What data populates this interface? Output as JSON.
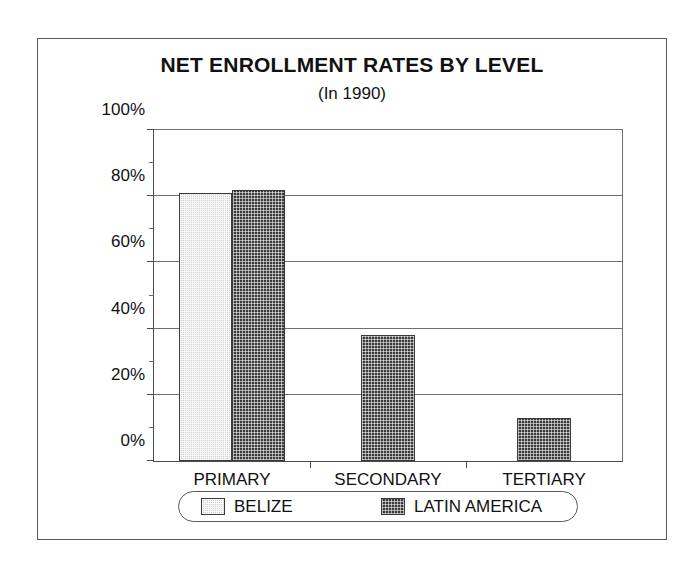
{
  "chart_data": {
    "type": "bar",
    "title": "NET ENROLLMENT RATES BY LEVEL",
    "subtitle": "(In 1990)",
    "xlabel": "",
    "ylabel": "",
    "categories": [
      "PRIMARY",
      "SECONDARY",
      "TERTIARY"
    ],
    "series": [
      {
        "name": "BELIZE",
        "values": [
          81,
          null,
          null
        ],
        "color": "#cccccc",
        "pattern": "light-stipple"
      },
      {
        "name": "LATIN AMERICA",
        "values": [
          82,
          38,
          13
        ],
        "color": "#3b3b3b",
        "pattern": "dark-crosshatch"
      }
    ],
    "ylim": [
      0,
      100
    ],
    "yticks": [
      0,
      20,
      40,
      60,
      80,
      100
    ],
    "ytick_labels": [
      "0%",
      "20%",
      "40%",
      "60%",
      "80%",
      "100%"
    ],
    "yminor_ticks": [
      10,
      30,
      50,
      70,
      90
    ],
    "grid": true,
    "grid_axis": "y",
    "legend_position": "bottom",
    "legend_entries": [
      "BELIZE",
      "LATIN AMERICA"
    ],
    "frame": true
  },
  "colors": {
    "belize": "#cccccc",
    "latin_america": "#3b3b3b",
    "axis": "#4a4a4a",
    "gridline": "#6f6f6f",
    "text": "#111111",
    "background": "#ffffff"
  }
}
